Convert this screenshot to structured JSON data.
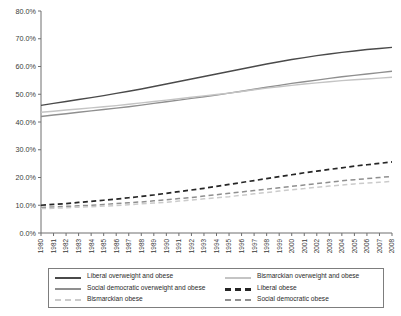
{
  "chart_data": {
    "type": "line",
    "title": "",
    "subtitle": "",
    "xlabel": "",
    "ylabel": "",
    "grid": false,
    "legend_position": "bottom",
    "xlim": [
      1980,
      2008
    ],
    "ylim": [
      0,
      80
    ],
    "ytick_labels": [
      "0.0%",
      "10.0%",
      "20.0%",
      "30.0%",
      "40.0%",
      "50.0%",
      "60.0%",
      "70.0%",
      "80.0%"
    ],
    "ytick_values": [
      0,
      10,
      20,
      30,
      40,
      50,
      60,
      70,
      80
    ],
    "x": [
      1980,
      1981,
      1982,
      1983,
      1984,
      1985,
      1986,
      1987,
      1988,
      1989,
      1990,
      1991,
      1992,
      1993,
      1994,
      1995,
      1996,
      1997,
      1998,
      1999,
      2000,
      2001,
      2002,
      2003,
      2004,
      2005,
      2006,
      2007,
      2008
    ],
    "xtick_labels": [
      "1980",
      "1981",
      "1982",
      "1983",
      "1984",
      "1985",
      "1986",
      "1987",
      "1988",
      "1989",
      "1990",
      "1991",
      "1992",
      "1993",
      "1994",
      "1995",
      "1996",
      "1997",
      "1998",
      "1999",
      "2000",
      "2001",
      "2002",
      "2003",
      "2004",
      "2005",
      "2006",
      "2007",
      "2008"
    ],
    "series": [
      {
        "name": "Liberal overweight and obese",
        "color": "#4a4a4a",
        "style": "solid",
        "width": 1.4,
        "values": [
          46.0,
          46.7,
          47.4,
          48.1,
          48.8,
          49.5,
          50.3,
          51.1,
          51.9,
          52.8,
          53.7,
          54.6,
          55.5,
          56.4,
          57.3,
          58.2,
          59.1,
          60.0,
          60.9,
          61.7,
          62.5,
          63.2,
          63.9,
          64.5,
          65.1,
          65.6,
          66.1,
          66.5,
          66.9
        ]
      },
      {
        "name": "Social democratic overweight and obese",
        "color": "#8f8f8f",
        "style": "solid",
        "width": 1.4,
        "values": [
          42.0,
          42.5,
          43.0,
          43.5,
          44.0,
          44.5,
          45.0,
          45.5,
          46.1,
          46.7,
          47.3,
          47.9,
          48.5,
          49.1,
          49.7,
          50.4,
          51.1,
          51.8,
          52.5,
          53.2,
          53.9,
          54.5,
          55.1,
          55.7,
          56.3,
          56.8,
          57.3,
          57.8,
          58.3
        ]
      },
      {
        "name": "Bismarckian overweight and obese",
        "color": "#c4c4c4",
        "style": "solid",
        "width": 1.4,
        "values": [
          43.5,
          43.9,
          44.3,
          44.7,
          45.1,
          45.5,
          45.9,
          46.4,
          46.9,
          47.4,
          47.9,
          48.4,
          48.9,
          49.4,
          49.9,
          50.4,
          51.0,
          51.6,
          52.2,
          52.7,
          53.2,
          53.7,
          54.1,
          54.5,
          54.9,
          55.2,
          55.5,
          55.8,
          56.1
        ]
      },
      {
        "name": "Liberal obese",
        "color": "#262626",
        "style": "dashed",
        "width": 1.7,
        "values": [
          10.0,
          10.3,
          10.6,
          11.0,
          11.4,
          11.8,
          12.2,
          12.7,
          13.2,
          13.7,
          14.3,
          14.9,
          15.5,
          16.1,
          16.8,
          17.5,
          18.2,
          18.9,
          19.6,
          20.3,
          21.0,
          21.7,
          22.3,
          22.9,
          23.5,
          24.1,
          24.6,
          25.1,
          25.6
        ]
      },
      {
        "name": "Social democratic obese",
        "color": "#8f8f8f",
        "style": "dashed",
        "width": 1.5,
        "values": [
          9.2,
          9.4,
          9.6,
          9.8,
          10.0,
          10.3,
          10.6,
          10.9,
          11.2,
          11.6,
          12.0,
          12.4,
          12.8,
          13.3,
          13.8,
          14.3,
          14.8,
          15.3,
          15.8,
          16.3,
          16.8,
          17.3,
          17.8,
          18.3,
          18.8,
          19.2,
          19.6,
          20.0,
          20.4
        ]
      },
      {
        "name": "Bismarckian obese",
        "color": "#cbcbcb",
        "style": "dashed",
        "width": 1.5,
        "values": [
          8.8,
          8.9,
          9.1,
          9.3,
          9.5,
          9.7,
          9.9,
          10.2,
          10.5,
          10.8,
          11.1,
          11.5,
          11.9,
          12.3,
          12.7,
          13.1,
          13.6,
          14.1,
          14.6,
          15.1,
          15.6,
          16.0,
          16.5,
          16.9,
          17.3,
          17.7,
          18.0,
          18.3,
          18.6
        ]
      }
    ]
  },
  "axes": {
    "axis_color": "#6e6e6e",
    "tick_color": "#6e6e6e"
  },
  "legend": {
    "border_color": "#7d7d7d",
    "items": [
      {
        "label": "Liberal overweight and obese",
        "color": "#4a4a4a",
        "style": "solid",
        "thickness": 2
      },
      {
        "label": "Bismarckian overweight and obese",
        "color": "#c4c4c4",
        "style": "solid",
        "thickness": 2
      },
      {
        "label": "Social democratic overweight and obese",
        "color": "#8f8f8f",
        "style": "solid",
        "thickness": 2
      },
      {
        "label": "Liberal obese",
        "color": "#262626",
        "style": "dashed",
        "thickness": 3
      },
      {
        "label": "Bismarckian obese",
        "color": "#cbcbcb",
        "style": "dashed",
        "thickness": 2
      },
      {
        "label": "Social democratic obese",
        "color": "#8f8f8f",
        "style": "dashed",
        "thickness": 2
      }
    ]
  }
}
